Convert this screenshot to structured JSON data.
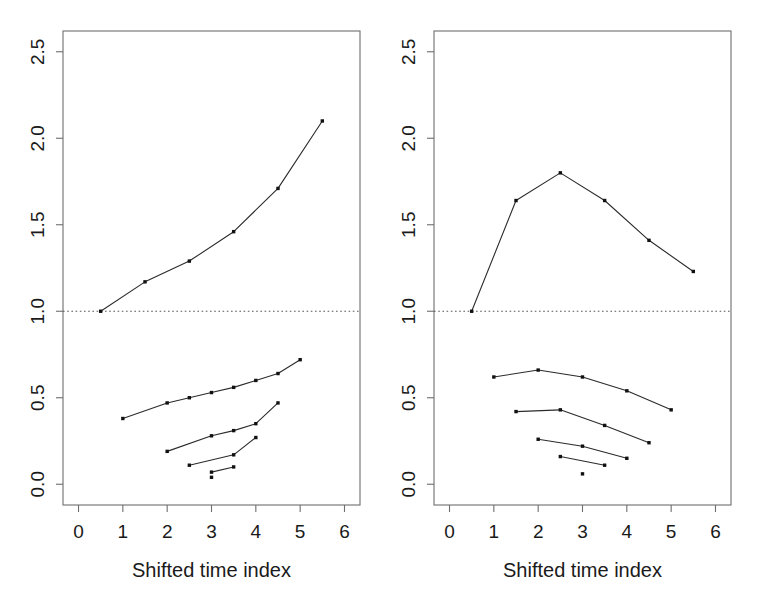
{
  "figure": {
    "panel_count": 2,
    "background": "#ffffff",
    "line_color": "#2b2b2b",
    "point_color": "#111111",
    "frame_color": "#6e6e6e",
    "refline_color": "#555555"
  },
  "chart_data": [
    {
      "type": "line",
      "panel": "left",
      "title": "",
      "xlabel": "Shifted time index",
      "ylabel": "",
      "xlim": [
        -0.35,
        6.35
      ],
      "ylim": [
        -0.12,
        2.62
      ],
      "xticks": [
        0,
        1,
        2,
        3,
        4,
        5,
        6
      ],
      "xticklabels": [
        "0",
        "1",
        "2",
        "3",
        "4",
        "5",
        "6"
      ],
      "yticks": [
        0.0,
        0.5,
        1.0,
        1.5,
        2.0,
        2.5
      ],
      "yticklabels": [
        "0.0",
        "0.5",
        "1.0",
        "1.5",
        "2.0",
        "2.5"
      ],
      "grid": false,
      "legend": "none",
      "reference_lines": [
        {
          "orientation": "horizontal",
          "value": 1.0,
          "style": "dotted"
        }
      ],
      "series": [
        {
          "name": "upper-curve",
          "x": [
            0.5,
            1.5,
            2.5,
            3.5,
            4.5,
            5.5
          ],
          "values": [
            1.0,
            1.17,
            1.29,
            1.46,
            1.71,
            2.1
          ]
        },
        {
          "name": "lower-curve-1",
          "x": [
            1.0,
            2.0,
            2.5,
            3.0,
            3.5,
            4.0,
            4.5,
            5.0
          ],
          "values": [
            0.38,
            0.47,
            0.5,
            0.53,
            0.56,
            0.6,
            0.64,
            0.72
          ]
        },
        {
          "name": "lower-curve-2",
          "x": [
            2.0,
            3.0,
            3.5,
            4.0,
            4.5
          ],
          "values": [
            0.19,
            0.28,
            0.31,
            0.35,
            0.47
          ]
        },
        {
          "name": "lower-curve-3",
          "x": [
            2.5,
            3.5,
            4.0
          ],
          "values": [
            0.11,
            0.17,
            0.27
          ]
        },
        {
          "name": "lower-curve-4",
          "x": [
            3.0,
            3.5
          ],
          "values": [
            0.07,
            0.1
          ]
        },
        {
          "name": "isolated-point",
          "x": [
            3.0
          ],
          "values": [
            0.04
          ]
        }
      ]
    },
    {
      "type": "line",
      "panel": "right",
      "title": "",
      "xlabel": "Shifted time index",
      "ylabel": "",
      "xlim": [
        -0.35,
        6.35
      ],
      "ylim": [
        -0.12,
        2.62
      ],
      "xticks": [
        0,
        1,
        2,
        3,
        4,
        5,
        6
      ],
      "xticklabels": [
        "0",
        "1",
        "2",
        "3",
        "4",
        "5",
        "6"
      ],
      "yticks": [
        0.0,
        0.5,
        1.0,
        1.5,
        2.0,
        2.5
      ],
      "yticklabels": [
        "0.0",
        "0.5",
        "1.0",
        "1.5",
        "2.0",
        "2.5"
      ],
      "grid": false,
      "legend": "none",
      "reference_lines": [
        {
          "orientation": "horizontal",
          "value": 1.0,
          "style": "dotted"
        }
      ],
      "series": [
        {
          "name": "upper-curve",
          "x": [
            0.5,
            1.5,
            2.5,
            3.5,
            4.5,
            5.5
          ],
          "values": [
            1.0,
            1.64,
            1.8,
            1.64,
            1.41,
            1.23
          ]
        },
        {
          "name": "lower-curve-1",
          "x": [
            1.0,
            2.0,
            3.0,
            4.0,
            5.0
          ],
          "values": [
            0.62,
            0.66,
            0.62,
            0.54,
            0.43
          ]
        },
        {
          "name": "lower-curve-2",
          "x": [
            1.5,
            2.5,
            3.5,
            4.5
          ],
          "values": [
            0.42,
            0.43,
            0.34,
            0.24
          ]
        },
        {
          "name": "lower-curve-3",
          "x": [
            2.0,
            3.0,
            4.0
          ],
          "values": [
            0.26,
            0.22,
            0.15
          ]
        },
        {
          "name": "lower-curve-4",
          "x": [
            2.5,
            3.5
          ],
          "values": [
            0.16,
            0.11
          ]
        },
        {
          "name": "isolated-point",
          "x": [
            3.0
          ],
          "values": [
            0.06
          ]
        }
      ]
    }
  ]
}
